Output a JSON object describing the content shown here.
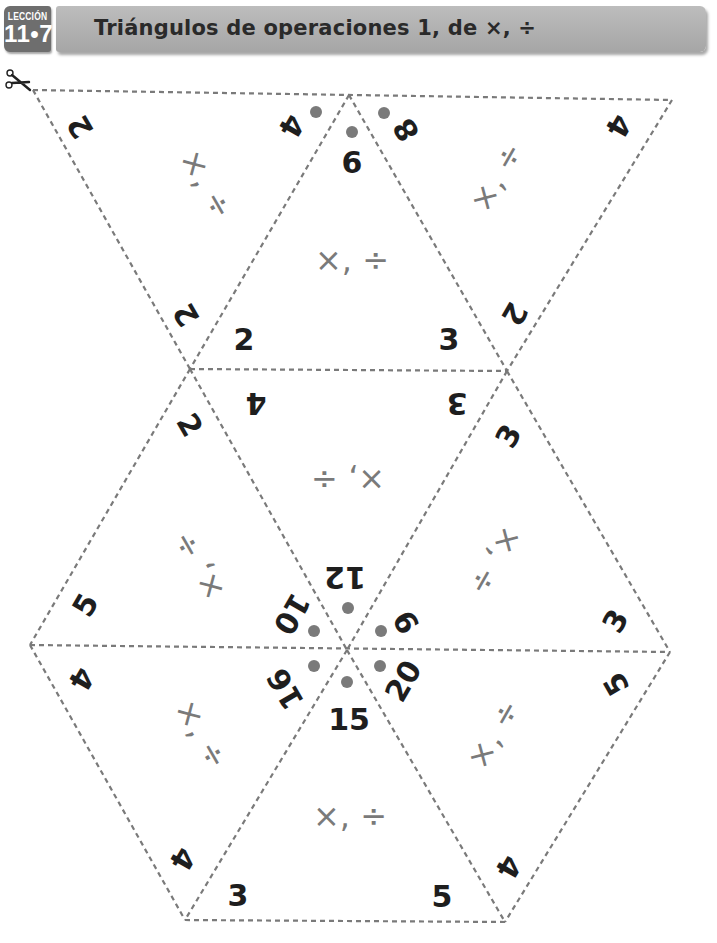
{
  "header": {
    "lesson_label": "LECCIÓN",
    "lesson_number": "11•7",
    "title": "Triángulos de operaciones 1, de ×, ÷"
  },
  "icons": {
    "scissors": "scissors-icon"
  },
  "colors": {
    "badge": "#6e6e6e",
    "title_bar": "#b0b0b0",
    "dashed_line": "#7a7a7a",
    "dot": "#7a7a7a",
    "numbers": "#1e1e1e",
    "operations": "#7a7a7a"
  },
  "triangles": [
    {
      "id": "A",
      "orientation": "down",
      "operations": "×, ÷",
      "numbers": [
        "2",
        "4",
        "2"
      ],
      "dot_on": "4"
    },
    {
      "id": "B",
      "orientation": "up",
      "operations": "×, ÷",
      "numbers": [
        "6",
        "2",
        "3"
      ],
      "dot_on": "6"
    },
    {
      "id": "C",
      "orientation": "down",
      "operations": "×, ÷",
      "numbers": [
        "8",
        "4",
        "2"
      ],
      "dot_on": "8"
    },
    {
      "id": "D",
      "orientation": "down",
      "operations": "×, ÷",
      "numbers": [
        "4",
        "3",
        "12"
      ],
      "dot_on": "12"
    },
    {
      "id": "E",
      "orientation": "up",
      "operations": "×, ÷",
      "numbers": [
        "2",
        "5",
        "10"
      ],
      "dot_on": "10"
    },
    {
      "id": "F",
      "orientation": "up",
      "operations": "×, ÷",
      "numbers": [
        "3",
        "9",
        "3"
      ],
      "dot_on": "9"
    },
    {
      "id": "G",
      "orientation": "down",
      "operations": "×, ÷",
      "numbers": [
        "4",
        "16",
        "4"
      ],
      "dot_on": "16"
    },
    {
      "id": "H",
      "orientation": "up",
      "operations": "×, ÷",
      "numbers": [
        "15",
        "3",
        "5"
      ],
      "dot_on": "15"
    },
    {
      "id": "I",
      "orientation": "down",
      "operations": "×, ÷",
      "numbers": [
        "20",
        "5",
        "4"
      ],
      "dot_on": "20"
    }
  ]
}
